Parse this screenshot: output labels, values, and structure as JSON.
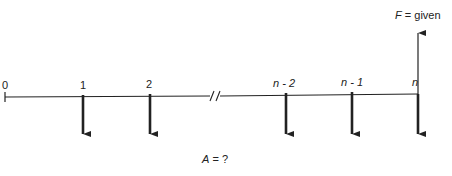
{
  "diagram": {
    "type": "cash-flow-diagram",
    "period_labels": [
      "0",
      "1",
      "2",
      "n - 2",
      "n - 1",
      "n"
    ],
    "future_value_label": {
      "symbol": "F",
      "text": " = given"
    },
    "annuity_label": {
      "symbol": "A",
      "text": " = ?"
    },
    "break_mark": "//",
    "colors": {
      "line": "#222222",
      "background": "#ffffff"
    }
  }
}
